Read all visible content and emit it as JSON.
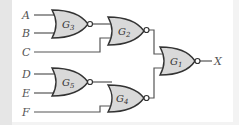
{
  "diagram": {
    "type": "logic-circuit",
    "gate_type": "NOR",
    "inputs": [
      {
        "label": "A"
      },
      {
        "label": "B"
      },
      {
        "label": "C"
      },
      {
        "label": "D"
      },
      {
        "label": "E"
      },
      {
        "label": "F"
      }
    ],
    "output": {
      "label": "X"
    },
    "gates": [
      {
        "id": "G3",
        "letter": "G",
        "sub": "3",
        "inputs": [
          "A",
          "B"
        ]
      },
      {
        "id": "G2",
        "letter": "G",
        "sub": "2",
        "inputs": [
          "G3",
          "C"
        ]
      },
      {
        "id": "G5",
        "letter": "G",
        "sub": "5",
        "inputs": [
          "D",
          "E"
        ]
      },
      {
        "id": "G4",
        "letter": "G",
        "sub": "4",
        "inputs": [
          "G5",
          "F"
        ]
      },
      {
        "id": "G1",
        "letter": "G",
        "sub": "1",
        "inputs": [
          "G2",
          "G4"
        ]
      }
    ],
    "colors": {
      "gate_fill": "#d9d9d9",
      "stroke": "#333333",
      "background": "#ffffff"
    }
  }
}
